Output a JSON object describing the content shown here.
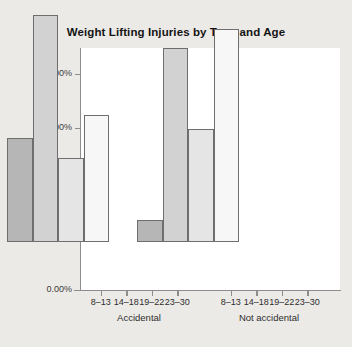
{
  "chart_data": {
    "type": "bar",
    "title": "Weight Lifting Injuries by Type and Age",
    "xlabel": "",
    "ylabel": "Percent",
    "ylim": [
      0,
      45
    ],
    "grid": false,
    "legend": "none",
    "ytick_labels": [
      "0.00%",
      "10.00%",
      "20.00%",
      "30.00%",
      "40.00%"
    ],
    "ytick_values": [
      0,
      10,
      20,
      30,
      40
    ],
    "groups": [
      "Accidental",
      "Not accidental"
    ],
    "categories": [
      "8-13",
      "14-18",
      "19-22",
      "23-30"
    ],
    "series": [
      {
        "name": "Accidental",
        "values": [
          19.3,
          42.0,
          15.6,
          23.5
        ]
      },
      {
        "name": "Not accidental",
        "values": [
          4.0,
          36.0,
          20.9,
          39.5
        ]
      }
    ],
    "bars": [
      {
        "group": "Accidental",
        "category": "8-13",
        "value": 19.3,
        "color": "#b6b6b6"
      },
      {
        "group": "Accidental",
        "category": "14-18",
        "value": 42.0,
        "color": "#d2d2d2"
      },
      {
        "group": "Accidental",
        "category": "19-22",
        "value": 15.6,
        "color": "#e5e5e5"
      },
      {
        "group": "Accidental",
        "category": "23-30",
        "value": 23.5,
        "color": "#f7f7f7"
      },
      {
        "group": "Not accidental",
        "category": "8-13",
        "value": 4.0,
        "color": "#b6b6b6"
      },
      {
        "group": "Not accidental",
        "category": "14-18",
        "value": 36.0,
        "color": "#d2d2d2"
      },
      {
        "group": "Not accidental",
        "category": "19-22",
        "value": 20.9,
        "color": "#e5e5e5"
      },
      {
        "group": "Not accidental",
        "category": "23-30",
        "value": 39.5,
        "color": "#f7f7f7"
      }
    ],
    "colors": {
      "plot_background": "#ffffff",
      "figure_background": "#eceae7",
      "axis": "#8d8d8d",
      "bar_outline": "#6e6e6e",
      "text": "#141414"
    }
  }
}
